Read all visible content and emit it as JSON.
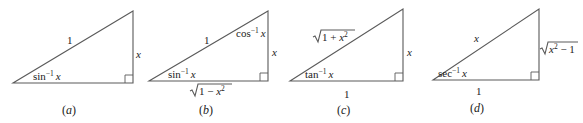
{
  "diagrams": [
    {
      "caption": "(a)",
      "caption_letter": "a",
      "angle_label": {
        "fn": "sin",
        "exp": "−1",
        "var": "x"
      },
      "hypotenuse": "1",
      "opposite": "x",
      "adjacent": ""
    },
    {
      "caption": "(b)",
      "caption_letter": "b",
      "angle_label": {
        "fn": "sin",
        "exp": "−1",
        "var": "x"
      },
      "top_angle_label": {
        "fn": "cos",
        "exp": "−1",
        "var": "x"
      },
      "hypotenuse": "1",
      "opposite": "x",
      "adjacent": {
        "radicand_pre": "1 − ",
        "var": "x",
        "exp": "2",
        "radicand_post": ""
      }
    },
    {
      "caption": "(c)",
      "caption_letter": "c",
      "angle_label": {
        "fn": "tan",
        "exp": "−1",
        "var": "x"
      },
      "hypotenuse": {
        "radicand_pre": "1 + ",
        "var": "x",
        "exp": "2",
        "radicand_post": ""
      },
      "opposite": "x",
      "adjacent": "1"
    },
    {
      "caption": "(d)",
      "caption_letter": "d",
      "angle_label": {
        "fn": "sec",
        "exp": "−1",
        "var": "x"
      },
      "hypotenuse": "x",
      "opposite": {
        "radicand_pre": "",
        "var": "x",
        "exp": "2",
        "radicand_post": " − 1"
      },
      "adjacent": "1"
    }
  ],
  "colors": {
    "line": "#5a5a5a",
    "text": "#222222",
    "background": "#ffffff"
  }
}
